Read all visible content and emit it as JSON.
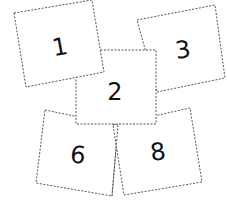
{
  "diagram": {
    "type": "overlapping-number-cards",
    "cards": [
      {
        "label": "3",
        "points": "137,20 215,5 225,78 157,92",
        "text_x": 183,
        "text_y": 50,
        "rotate": -8
      },
      {
        "label": "6",
        "points": "45,110 118,125 112,196 36,183",
        "text_x": 78,
        "text_y": 155,
        "rotate": 6
      },
      {
        "label": "8",
        "points": "113,125 190,108 202,182 124,195",
        "text_x": 158,
        "text_y": 152,
        "rotate": -8
      },
      {
        "label": "2",
        "points": "76,50 156,50 156,124 76,124",
        "text_x": 115,
        "text_y": 92,
        "rotate": 0
      },
      {
        "label": "1",
        "points": "14,13 92,0 104,72 26,87",
        "text_x": 60,
        "text_y": 47,
        "rotate": -10
      }
    ],
    "stroke_color": "#555555",
    "number_color": "#111111"
  }
}
